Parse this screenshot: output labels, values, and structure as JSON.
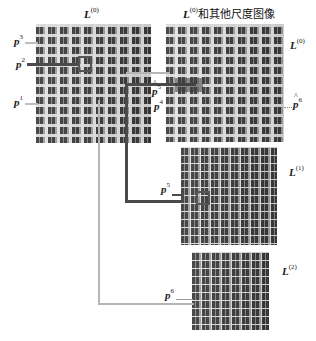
{
  "diagram": {
    "images": [
      {
        "id": "left",
        "title_var": "L",
        "title_sup": "(0)",
        "title_suffix": ""
      },
      {
        "id": "right-top",
        "title_var": "L",
        "title_sup": "(0)",
        "title_suffix": "和其他尺度图像",
        "side_var": "L",
        "side_sup": "(0)"
      },
      {
        "id": "right-mid",
        "side_var": "L",
        "side_sup": "(1)"
      },
      {
        "id": "right-bottom",
        "side_var": "L",
        "side_sup": "(2)"
      }
    ],
    "points": {
      "p3": {
        "var": "p",
        "sup": "3"
      },
      "p2": {
        "var": "p",
        "sup": "2"
      },
      "p1": {
        "var": "p",
        "sup": "1"
      },
      "p5hat": {
        "var": "p",
        "sup": "5",
        "hat": true
      },
      "p4": {
        "var": "p",
        "sup": "4"
      },
      "p6hat": {
        "var": "p",
        "sup": "6",
        "hat": true
      },
      "p5": {
        "var": "p",
        "sup": "5"
      },
      "p6": {
        "var": "p",
        "sup": "6"
      }
    },
    "colors": {
      "dark_line": "#4a4a4a",
      "gray_line": "#b5b5b5",
      "box": "#555555"
    }
  }
}
